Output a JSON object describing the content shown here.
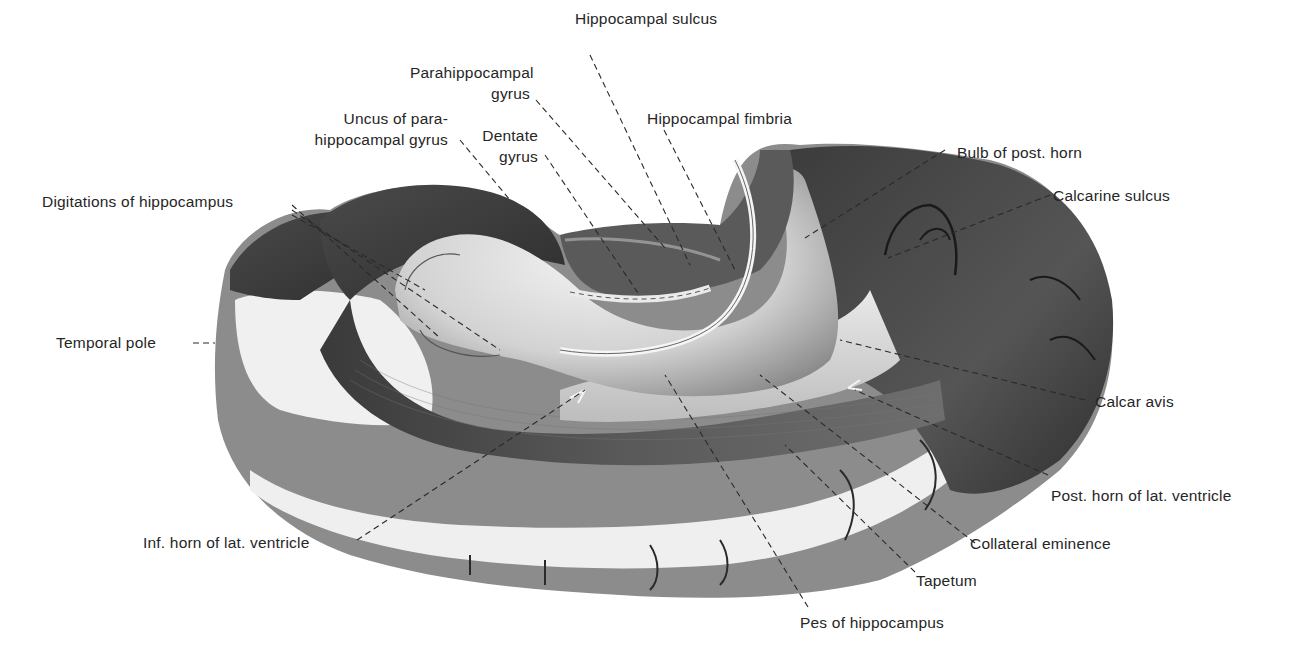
{
  "figure": {
    "colors": {
      "background": "#ffffff",
      "label_text": "#262626",
      "leader_line": "#2a2a2a",
      "cortex_dark": "#3a3a3a",
      "cortex_mid": "#7a7a7a",
      "white_matter": "#e8e8e8",
      "hippocampus_light": "#d6d6d6"
    }
  },
  "labels": {
    "hippocampal_sulcus": "Hippocampal sulcus",
    "parahippocampal_gyrus_1": "Parahippocampal",
    "parahippocampal_gyrus_2": "gyrus",
    "uncus_1": "Uncus of para-",
    "uncus_2": "hippocampal gyrus",
    "dentate_gyrus_1": "Dentate",
    "dentate_gyrus_2": "gyrus",
    "hippocampal_fimbria": "Hippocampal fimbria",
    "bulb_post_horn": "Bulb of post. horn",
    "calcarine_sulcus": "Calcarine sulcus",
    "digitations": "Digitations of hippocampus",
    "temporal_pole": "Temporal pole",
    "calcar_avis": "Calcar avis",
    "post_horn": "Post. horn of lat. ventricle",
    "inf_horn": "Inf. horn of lat. ventricle",
    "collateral_eminence": "Collateral eminence",
    "tapetum": "Tapetum",
    "pes_hippocampus": "Pes of hippocampus"
  }
}
